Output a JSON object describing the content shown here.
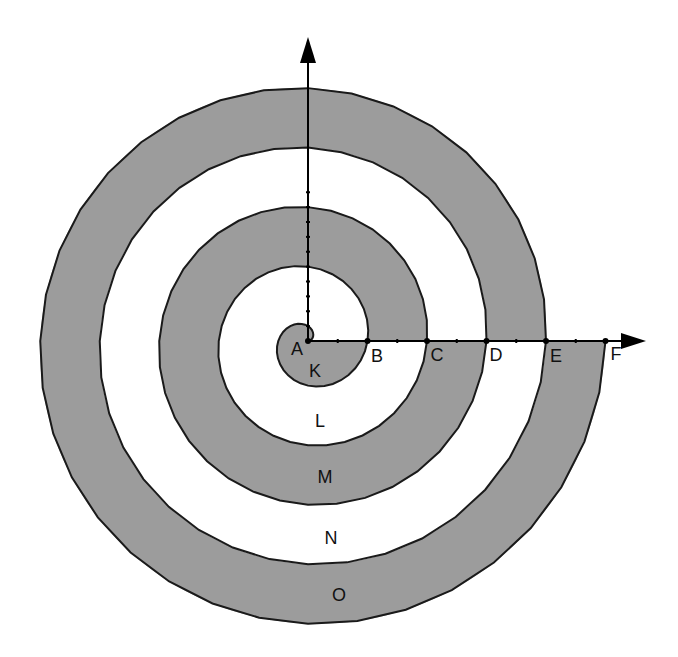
{
  "diagram": {
    "type": "archimedean-spiral",
    "colors": {
      "gray_fill": "#9c9c9c",
      "white_fill": "#ffffff",
      "stroke": "#1a1a1a",
      "axis": "#000000"
    },
    "origin": {
      "x": 308,
      "y": 341
    },
    "turn_spacing_px": 59.5,
    "turns": 5,
    "axis_points": [
      {
        "label": "A",
        "value": 0,
        "label_x": 297,
        "label_y": 349
      },
      {
        "label": "B",
        "value": 1,
        "label_x": 377,
        "label_y": 356
      },
      {
        "label": "C",
        "value": 2,
        "label_x": 437,
        "label_y": 355
      },
      {
        "label": "D",
        "value": 3,
        "label_x": 496,
        "label_y": 355
      },
      {
        "label": "E",
        "value": 4,
        "label_x": 556,
        "label_y": 356
      },
      {
        "label": "F",
        "value": 5,
        "label_x": 616,
        "label_y": 354
      }
    ],
    "regions": [
      {
        "label": "K",
        "fill": "gray",
        "label_x": 315,
        "label_y": 371
      },
      {
        "label": "L",
        "fill": "white",
        "label_x": 320,
        "label_y": 421
      },
      {
        "label": "M",
        "fill": "gray",
        "label_x": 325,
        "label_y": 477
      },
      {
        "label": "N",
        "fill": "white",
        "label_x": 331,
        "label_y": 538
      },
      {
        "label": "O",
        "fill": "gray",
        "label_x": 339,
        "label_y": 595
      }
    ],
    "x_axis": {
      "end_x": 646
    },
    "y_axis": {
      "end_y": 37
    }
  }
}
